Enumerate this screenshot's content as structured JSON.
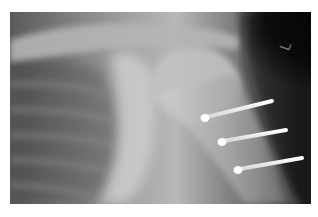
{
  "image": {
    "subject": "shoulder radiograph with three fixation screws in proximal humerus",
    "background": "#ffffff",
    "marker_label": "L",
    "screws": [
      {
        "head": [
          205,
          118
        ],
        "tip": [
          272,
          101
        ]
      },
      {
        "head": [
          222,
          142
        ],
        "tip": [
          286,
          130
        ]
      },
      {
        "head": [
          238,
          170
        ],
        "tip": [
          302,
          158
        ]
      }
    ]
  }
}
